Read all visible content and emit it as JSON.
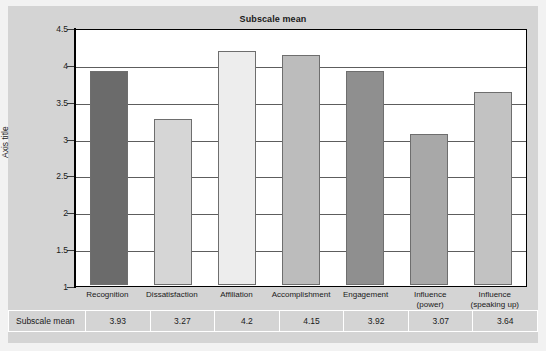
{
  "chart_data": {
    "type": "bar",
    "title": "Subscale mean",
    "xlabel": "",
    "ylabel": "Axis title",
    "ylim": [
      1,
      4.5
    ],
    "yticks": [
      "1",
      "1.5",
      "2",
      "2.5",
      "3",
      "3.5",
      "4",
      "4.5"
    ],
    "grid": true,
    "legend": "none",
    "categories": [
      "Recognition",
      "Dissatisfaction",
      "Affiliation",
      "Accomplishment",
      "Engagement",
      "Influence (power)",
      "Influence (speaking up)"
    ],
    "category_lines": [
      [
        "Recognition",
        ""
      ],
      [
        "Dissatisfaction",
        ""
      ],
      [
        "Affiliation",
        ""
      ],
      [
        "Accomplishment",
        ""
      ],
      [
        "Engagement",
        ""
      ],
      [
        "Influence",
        "(power)"
      ],
      [
        "Influence",
        "(speaking up)"
      ]
    ],
    "values": [
      3.93,
      3.27,
      4.2,
      4.15,
      3.92,
      3.07,
      3.64
    ],
    "bar_colors": [
      "#6b6b6b",
      "#d6d6d6",
      "#ededed",
      "#bcbcbc",
      "#8f8f8f",
      "#a8a8a8",
      "#c2c2c2"
    ],
    "series": [
      {
        "name": "Subscale mean",
        "values": [
          3.93,
          3.27,
          4.2,
          4.15,
          3.92,
          3.07,
          3.64
        ]
      }
    ]
  },
  "table": {
    "row_header": "Subscale mean",
    "values": [
      "3.93",
      "3.27",
      "4.2",
      "4.15",
      "3.92",
      "3.07",
      "3.64"
    ]
  },
  "colors": {
    "panel_background": "#d4d4d4",
    "plot_background": "#ffffff",
    "axis": "#000000",
    "gridline": "#5d5d5d",
    "text": "#1a1a1a"
  }
}
